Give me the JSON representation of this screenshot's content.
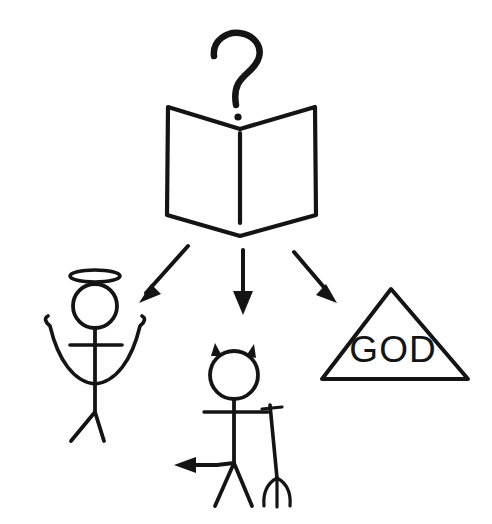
{
  "scene": {
    "title": "Question mark over open book with three outcomes",
    "background_color": "#ffffff",
    "ink_color": "#141414",
    "width": 492,
    "height": 524
  },
  "source": {
    "label": "question-mark",
    "glyph": "?",
    "description": "Hand drawn question mark above the book"
  },
  "book": {
    "label": "open-book",
    "description": "Open book seen from the front with centre spine"
  },
  "arrows": [
    {
      "name": "arrow-to-angel",
      "direction": "down-left",
      "target": "angel"
    },
    {
      "name": "arrow-to-devil",
      "direction": "down",
      "target": "devil"
    },
    {
      "name": "arrow-to-god",
      "direction": "down-right",
      "target": "god-triangle"
    }
  ],
  "outcomes": {
    "angel": {
      "label": "angel-figure",
      "parts": [
        "halo",
        "head",
        "wings",
        "arms",
        "body",
        "legs"
      ]
    },
    "devil": {
      "label": "devil-figure",
      "parts": [
        "horns",
        "head",
        "arms",
        "body",
        "legs",
        "tail",
        "pitchfork"
      ]
    },
    "god": {
      "label": "god-triangle",
      "text": "GOD",
      "shape": "triangle"
    }
  }
}
